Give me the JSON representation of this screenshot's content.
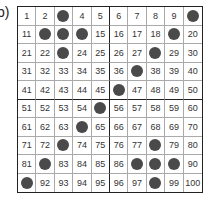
{
  "label": "b)",
  "grid": {
    "rows": 10,
    "cols": 10,
    "start": 1,
    "end": 100,
    "dot_color": "#4a4a4a",
    "dotted_numbers": [
      3,
      10,
      12,
      13,
      14,
      19,
      23,
      28,
      37,
      46,
      55,
      64,
      73,
      78,
      82,
      87,
      88,
      89,
      91,
      98
    ]
  }
}
